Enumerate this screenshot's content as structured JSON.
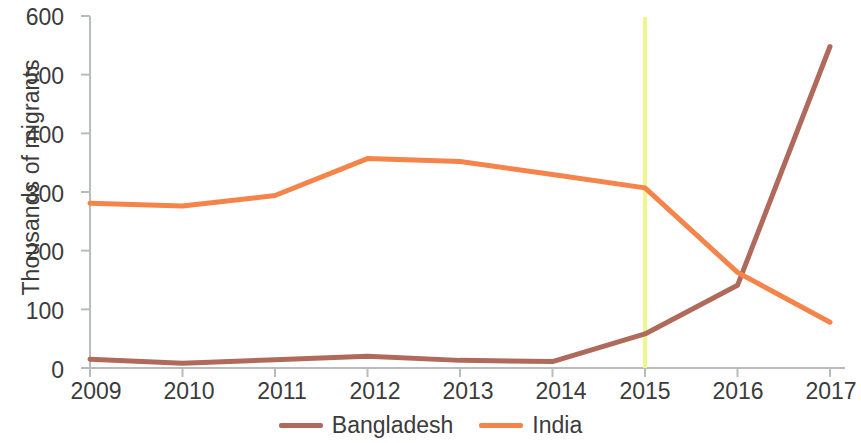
{
  "chart_data": {
    "type": "line",
    "title": "",
    "subtitle": "",
    "xlabel": "",
    "ylabel": "Thousands of migrants",
    "x": [
      2009,
      2010,
      2011,
      2012,
      2013,
      2014,
      2015,
      2016,
      2017
    ],
    "xtick_labels": [
      "2009",
      "2010",
      "2011",
      "2012",
      "2013",
      "2014",
      "2015",
      "2016",
      "2017"
    ],
    "ytick_labels": [
      "0",
      "100",
      "200",
      "300",
      "400",
      "500",
      "600"
    ],
    "yticks": [
      0,
      100,
      200,
      300,
      400,
      500,
      600
    ],
    "ylim": [
      0,
      600
    ],
    "xlim": [
      2009,
      2017
    ],
    "grid": false,
    "legend_position": "bottom",
    "series": [
      {
        "name": "Bangladesh",
        "color": "#b06a5c",
        "values": [
          15,
          8,
          14,
          20,
          13,
          11,
          58,
          141,
          548
        ]
      },
      {
        "name": "India",
        "color": "#f5844b",
        "values": [
          281,
          276,
          294,
          357,
          352,
          330,
          307,
          163,
          78
        ]
      }
    ],
    "annotations": [
      {
        "type": "vertical-line",
        "x": 2015,
        "color": "#eef78c",
        "label": ""
      }
    ],
    "axis_color": "#b9bcbd"
  },
  "legend": {
    "items": [
      {
        "label": "Bangladesh",
        "color": "#b06a5c"
      },
      {
        "label": "India",
        "color": "#f5844b"
      }
    ]
  }
}
